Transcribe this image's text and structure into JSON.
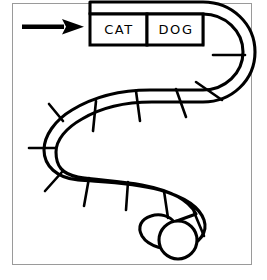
{
  "page": {
    "background_color": "#ffffff",
    "frame_color": "#9a9a9a",
    "ink_color": "#000000"
  },
  "arrow": {
    "name": "start-direction-arrow",
    "direction": "right",
    "color": "#000000"
  },
  "board": {
    "shape": "winding-s-track",
    "total_spaces": 16,
    "labeled_spaces": [
      {
        "index": 1,
        "label": "CAT"
      },
      {
        "index": 2,
        "label": "DOG"
      }
    ],
    "token": {
      "name": "game-token",
      "shape": "circle",
      "filled": false
    }
  }
}
